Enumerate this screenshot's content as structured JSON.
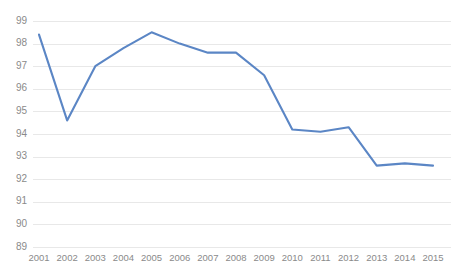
{
  "chart_data": {
    "type": "line",
    "title": "",
    "subtitle": "",
    "xlabel": "",
    "ylabel": "",
    "categories": [
      "2001",
      "2002",
      "2003",
      "2004",
      "2005",
      "2006",
      "2007",
      "2008",
      "2009",
      "2010",
      "2011",
      "2012",
      "2013",
      "2014",
      "2015"
    ],
    "x": [
      2001,
      2002,
      2003,
      2004,
      2005,
      2006,
      2007,
      2008,
      2009,
      2010,
      2011,
      2012,
      2013,
      2014,
      2015
    ],
    "values": [
      98.4,
      94.6,
      97.0,
      97.8,
      98.5,
      98.0,
      97.6,
      97.6,
      96.6,
      94.2,
      94.1,
      94.3,
      92.6,
      92.7,
      92.6
    ],
    "series": [
      {
        "name": "Series 1",
        "color": "#5b86c5",
        "values": [
          98.4,
          94.6,
          97.0,
          97.8,
          98.5,
          98.0,
          97.6,
          97.6,
          96.6,
          94.2,
          94.1,
          94.3,
          92.6,
          92.7,
          92.6
        ]
      }
    ],
    "ylim": [
      89,
      99
    ],
    "y_ticks": [
      89,
      90,
      91,
      92,
      93,
      94,
      95,
      96,
      97,
      98,
      99
    ],
    "y_tick_labels": [
      "89",
      "90",
      "91",
      "92",
      "93",
      "94",
      "95",
      "96",
      "97",
      "98",
      "99"
    ],
    "x_tick_labels": [
      "2001",
      "2002",
      "2003",
      "2004",
      "2005",
      "2006",
      "2007",
      "2008",
      "2009",
      "2010",
      "2011",
      "2012",
      "2013",
      "2014",
      "2015"
    ],
    "grid": {
      "horizontal": true,
      "vertical": false,
      "color": "#e8e8e8"
    },
    "legend": {
      "visible": false,
      "position": "none",
      "entries": []
    },
    "annotations": [],
    "colors": {
      "line": "#5b86c5",
      "gridline": "#e8e8e8",
      "tick_text": "#8a8a8a",
      "background": "#ffffff"
    },
    "plot_area": {
      "left": 33,
      "right": 451,
      "top": 21,
      "bottom": 247
    }
  }
}
